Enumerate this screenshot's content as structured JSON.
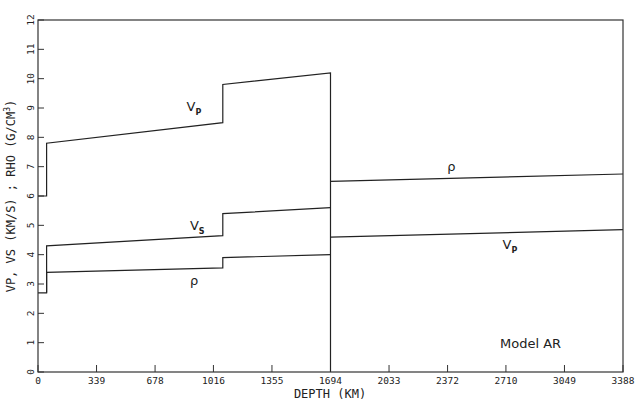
{
  "chart_data": {
    "type": "line",
    "title": "",
    "annotation": "Model AR",
    "xlabel": "DEPTH (KM)",
    "ylabel": "VP, VS (KM/S) ; RHO (G/CM³)",
    "xlim": [
      0,
      3388
    ],
    "ylim": [
      0,
      12
    ],
    "grid": false,
    "legend": "none (inline curve labels)",
    "x_ticks": [
      0,
      339,
      678,
      1016,
      1355,
      1694,
      2033,
      2372,
      2710,
      3049,
      3388
    ],
    "x_tick_labels": [
      "0",
      "339",
      "678",
      "1016",
      "1355",
      "1694",
      "2033",
      "2372",
      "2710",
      "3049",
      "3388"
    ],
    "y_ticks": [
      0,
      1,
      2,
      3,
      4,
      5,
      6,
      7,
      8,
      9,
      10,
      11,
      12
    ],
    "y_tick_labels": [
      "0",
      "1",
      "2",
      "3",
      "4",
      "5",
      "6",
      "7",
      "8",
      "9",
      "10",
      "11",
      "12"
    ],
    "series": [
      {
        "name": "Vp (mantle)",
        "label": "Vp",
        "points": [
          [
            0,
            6.0
          ],
          [
            50,
            6.0
          ],
          [
            50,
            7.8
          ],
          [
            1070,
            8.5
          ],
          [
            1070,
            9.8
          ],
          [
            1694,
            10.2
          ],
          [
            1694,
            0
          ]
        ]
      },
      {
        "name": "Vs (mantle)",
        "label": "Vs",
        "points": [
          [
            50,
            2.7
          ],
          [
            50,
            4.3
          ],
          [
            1070,
            4.65
          ],
          [
            1070,
            5.4
          ],
          [
            1694,
            5.6
          ]
        ]
      },
      {
        "name": "rho (mantle)",
        "label": "ρ",
        "points": [
          [
            0,
            2.7
          ],
          [
            50,
            2.7
          ],
          [
            50,
            3.4
          ],
          [
            1070,
            3.55
          ],
          [
            1070,
            3.9
          ],
          [
            1694,
            4.0
          ]
        ]
      },
      {
        "name": "rho (core)",
        "label": "ρ",
        "points": [
          [
            1694,
            6.5
          ],
          [
            3388,
            6.75
          ]
        ]
      },
      {
        "name": "Vp (core)",
        "label": "Vp",
        "points": [
          [
            1694,
            4.6
          ],
          [
            3388,
            4.85
          ]
        ]
      }
    ],
    "curve_labels": [
      {
        "text": "V",
        "sub": "P",
        "x": 860,
        "y": 8.9
      },
      {
        "text": "V",
        "sub": "S",
        "x": 880,
        "y": 4.85
      },
      {
        "text": "ρ",
        "sub": "",
        "x": 880,
        "y": 2.95
      },
      {
        "text": "ρ",
        "sub": "",
        "x": 2370,
        "y": 6.85
      },
      {
        "text": "V",
        "sub": "P",
        "x": 2690,
        "y": 4.2
      }
    ]
  },
  "labels": {
    "model": "Model AR",
    "xlabel": "DEPTH (KM)",
    "ylabel": "VP, VS (KM/S) ; RHO (G/CM",
    "ylabel_sup": "3",
    "ylabel_end": ")"
  }
}
